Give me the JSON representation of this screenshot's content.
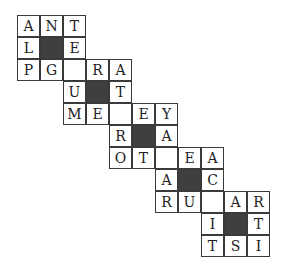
{
  "puzzle": {
    "cell_width": 23,
    "cell_height": 22,
    "black_color": "#3f3f3f",
    "rows": [
      {
        "start": 0,
        "cells": [
          "A",
          "N",
          "T"
        ]
      },
      {
        "start": 0,
        "cells": [
          "L",
          "#",
          "E"
        ]
      },
      {
        "start": 0,
        "cells": [
          "P",
          "G",
          "",
          "R",
          "A"
        ]
      },
      {
        "start": 2,
        "cells": [
          "U",
          "#",
          "T"
        ]
      },
      {
        "start": 2,
        "cells": [
          "M",
          "E",
          "",
          "E",
          "Y"
        ]
      },
      {
        "start": 4,
        "cells": [
          "R",
          "#",
          "A"
        ]
      },
      {
        "start": 4,
        "cells": [
          "O",
          "T",
          "",
          "E",
          "A"
        ]
      },
      {
        "start": 6,
        "cells": [
          "A",
          "#",
          "C"
        ]
      },
      {
        "start": 6,
        "cells": [
          "R",
          "U",
          "",
          "A",
          "R"
        ]
      },
      {
        "start": 8,
        "cells": [
          "I",
          "#",
          "T"
        ]
      },
      {
        "start": 8,
        "cells": [
          "T",
          "S",
          "I"
        ]
      }
    ]
  }
}
